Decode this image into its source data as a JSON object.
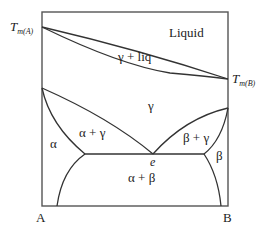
{
  "diagram": {
    "type": "binary eutectic phase diagram",
    "axis_labels": {
      "left": "A",
      "right": "B"
    },
    "melting_points": {
      "left": {
        "main": "T",
        "sub": "m(A)"
      },
      "right": {
        "main": "T",
        "sub": "m(B)"
      }
    },
    "regions": {
      "liquid": "Liquid",
      "gamma_liq": "γ + liq",
      "gamma": "γ",
      "alpha": "α",
      "alpha_gamma": "α + γ",
      "beta_gamma": "β + γ",
      "beta": "β",
      "alpha_beta": "α + β"
    },
    "points": {
      "eutectoid": "e"
    },
    "colors": {
      "line": "#333333",
      "frame": "#555555",
      "background": "#ffffff"
    }
  }
}
